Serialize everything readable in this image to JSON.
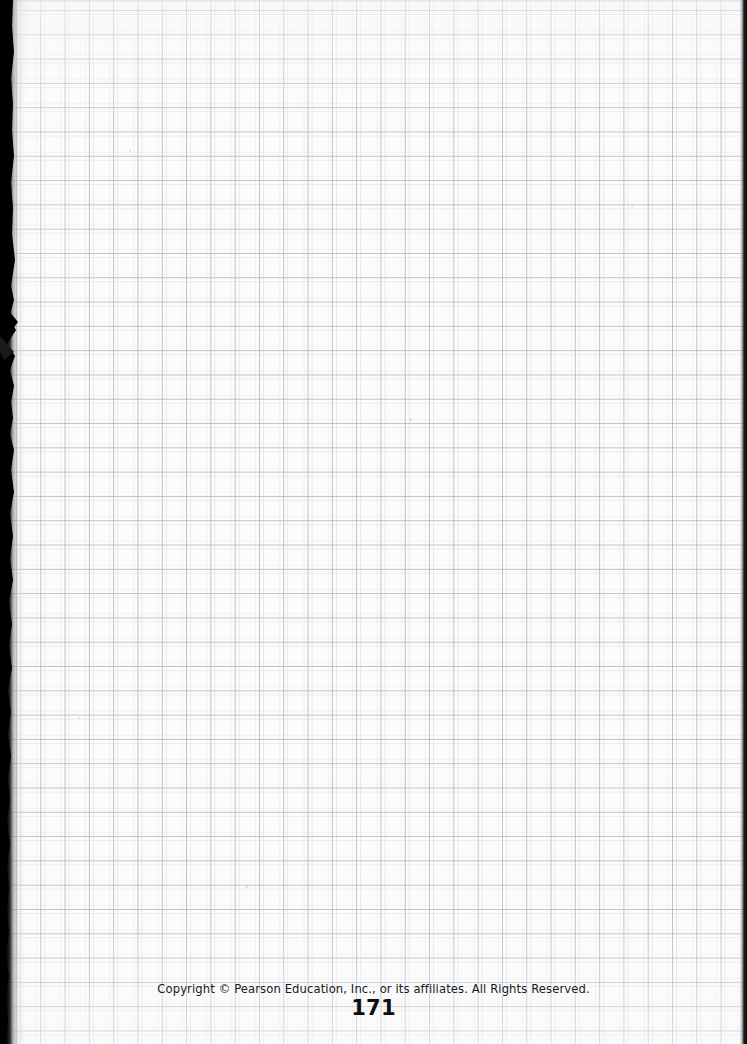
{
  "document": {
    "type": "scanned-textbook-page",
    "page_content": "blank grid / graph paper",
    "background_color": "#fcfcfc"
  },
  "grid": {
    "cell_size_px": 24.3,
    "line_color": "#969ea8",
    "ghost_line_color": "#c4cbd4",
    "offset_x_px": 16,
    "offset_y_px": 10
  },
  "scan_artifacts": {
    "left_gutter_shadow_color": "#000000",
    "right_edge_color": "#0d0d0d",
    "left_gutter_width_px": 26,
    "right_edge_width_px": 9
  },
  "footer": {
    "copyright": "Copyright © Pearson Education, Inc., or its affiliates. All Rights Reserved.",
    "page_number": "171",
    "text_color": "#19191b",
    "page_number_color": "#0d0d0f"
  }
}
